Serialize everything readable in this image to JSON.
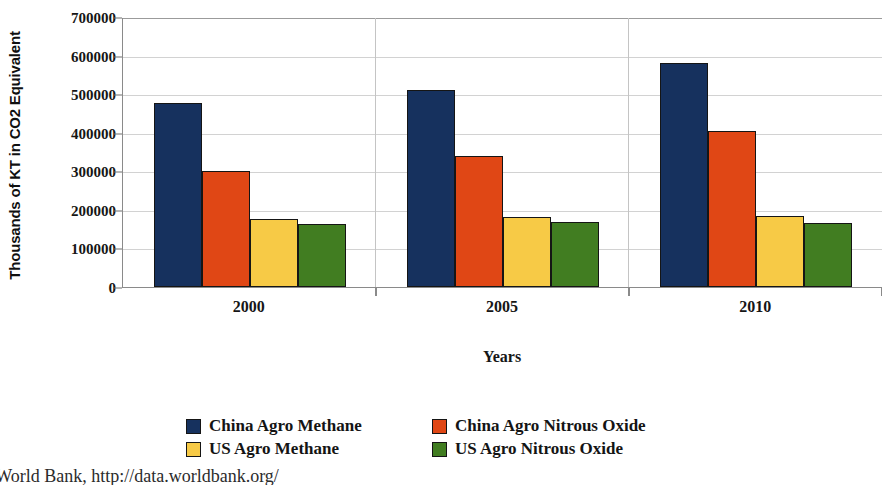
{
  "chart_data": {
    "type": "bar",
    "title": "",
    "xlabel": "Years",
    "ylabel": "Thousands of KT in CO2 Equivalent",
    "categories": [
      "2000",
      "2005",
      "2010"
    ],
    "ylim": [
      0,
      700000
    ],
    "yticks": [
      "0",
      "100000",
      "200000",
      "300000",
      "400000",
      "500000",
      "600000",
      "700000"
    ],
    "ytick_values": [
      0,
      100000,
      200000,
      300000,
      400000,
      500000,
      600000,
      700000
    ],
    "grid": true,
    "legend_position": "bottom",
    "series": [
      {
        "name": "China Agro Methane",
        "color": "#16315e",
        "values": [
          478000,
          510000,
          580000
        ]
      },
      {
        "name": "China Agro Nitrous Oxide",
        "color": "#e04715",
        "values": [
          301000,
          340000,
          405000
        ]
      },
      {
        "name": "US Agro Methane",
        "color": "#f7ca46",
        "values": [
          176000,
          182000,
          185000
        ]
      },
      {
        "name": "US Agro Nitrous Oxide",
        "color": "#417d21",
        "values": [
          163000,
          169000,
          165000
        ]
      }
    ]
  },
  "source_note": ": World Bank, http://data.worldbank.org/"
}
